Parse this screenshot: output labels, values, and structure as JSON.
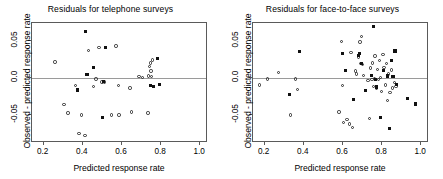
{
  "figure": {
    "width": 443,
    "height": 179,
    "background": "#ffffff",
    "marker_colors": {
      "open_circle": "#2b2b2b",
      "filled_square": "#111111",
      "zero_line": "#9a9a9a",
      "axis": "#5a5a5a"
    }
  },
  "chart_data": [
    {
      "type": "scatter",
      "title": "Residuals for telephone surveys",
      "xlabel": "Predicted response rate",
      "ylabel": "Observed - predicted response rate",
      "xlim": [
        0.14,
        1.04
      ],
      "ylim": [
        -0.088,
        0.075
      ],
      "xticks": [
        0.2,
        0.4,
        0.6,
        0.8,
        1.0
      ],
      "xticklabels": [
        "0.2",
        "0.4",
        "0.6",
        "0.8",
        "1.0"
      ],
      "yticks": [
        -0.05,
        0.0,
        0.05
      ],
      "yticklabels": [
        "-0.05",
        "0.0",
        "0.05"
      ],
      "grid": false,
      "legend": "none",
      "annotations": [
        {
          "type": "hline",
          "y": 0.0,
          "color": "#9a9a9a"
        }
      ],
      "series": [
        {
          "name": "open circles",
          "marker": "open-circle",
          "points": [
            [
              0.258,
              0.022
            ],
            [
              0.303,
              -0.036
            ],
            [
              0.323,
              -0.047
            ],
            [
              0.363,
              -0.01
            ],
            [
              0.381,
              -0.075
            ],
            [
              0.392,
              -0.05
            ],
            [
              0.41,
              -0.078
            ],
            [
              0.428,
              0.038
            ],
            [
              0.455,
              -0.011
            ],
            [
              0.468,
              -0.001
            ],
            [
              0.482,
              0.042
            ],
            [
              0.498,
              -0.005
            ],
            [
              0.512,
              -0.005
            ],
            [
              0.545,
              -0.05
            ],
            [
              0.57,
              0.044
            ],
            [
              0.583,
              -0.01
            ],
            [
              0.585,
              -0.05
            ],
            [
              0.641,
              -0.013
            ],
            [
              0.648,
              -0.046
            ],
            [
              0.687,
              0.002
            ],
            [
              0.704,
              0.001
            ],
            [
              0.733,
              -0.047
            ],
            [
              0.735,
              0.003
            ],
            [
              0.742,
              0.016
            ],
            [
              0.745,
              0.021
            ],
            [
              0.748,
              0.01
            ],
            [
              0.752,
              0.002
            ],
            [
              0.757,
              0.025
            ]
          ]
        },
        {
          "name": "filled squares",
          "marker": "filled-square",
          "points": [
            [
              0.372,
              -0.016
            ],
            [
              0.415,
              0.063
            ],
            [
              0.421,
              0.005
            ],
            [
              0.455,
              0.014
            ],
            [
              0.501,
              -0.053
            ],
            [
              0.507,
              -0.005
            ],
            [
              0.515,
              0.042
            ],
            [
              0.747,
              -0.01
            ],
            [
              0.762,
              -0.011
            ],
            [
              0.782,
              0.027
            ],
            [
              0.79,
              -0.009
            ]
          ]
        }
      ]
    },
    {
      "type": "scatter",
      "title": "Residuals for face-to-face surveys",
      "xlabel": "Predicted response rate",
      "ylabel": "Observed - predicted response rate",
      "xlim": [
        0.14,
        1.04
      ],
      "ylim": [
        -0.088,
        0.075
      ],
      "xticks": [
        0.2,
        0.4,
        0.6,
        0.8,
        1.0
      ],
      "xticklabels": [
        "0.2",
        "0.4",
        "0.6",
        "0.8",
        "1.0"
      ],
      "yticks": [
        -0.05,
        0.0,
        0.05
      ],
      "yticklabels": [
        "-0.05",
        "0.0",
        "0.05"
      ],
      "grid": false,
      "legend": "none",
      "annotations": [
        {
          "type": "hline",
          "y": 0.0,
          "color": "#9a9a9a"
        }
      ],
      "series": [
        {
          "name": "open circles",
          "marker": "open-circle",
          "points": [
            [
              0.172,
              -0.009
            ],
            [
              0.213,
              -0.001
            ],
            [
              0.27,
              0.008
            ],
            [
              0.33,
              -0.05
            ],
            [
              0.356,
              -0.001
            ],
            [
              0.366,
              -0.015
            ],
            [
              0.58,
              -0.046
            ],
            [
              0.592,
              0.05
            ],
            [
              0.596,
              -0.01
            ],
            [
              0.604,
              -0.06
            ],
            [
              0.62,
              -0.056
            ],
            [
              0.634,
              -0.062
            ],
            [
              0.64,
              0.035
            ],
            [
              0.648,
              -0.067
            ],
            [
              0.664,
              0.01
            ],
            [
              0.668,
              0.006
            ],
            [
              0.68,
              0.029
            ],
            [
              0.686,
              0.049
            ],
            [
              0.69,
              0.02
            ],
            [
              0.694,
              0.057
            ],
            [
              0.7,
              0.019
            ],
            [
              0.706,
              0.004
            ],
            [
              0.728,
              -0.003
            ],
            [
              0.736,
              -0.055
            ],
            [
              0.742,
              0.014
            ],
            [
              0.748,
              -0.002
            ],
            [
              0.752,
              0.021
            ],
            [
              0.756,
              -0.011
            ],
            [
              0.76,
              0.0
            ],
            [
              0.764,
              0.03
            ],
            [
              0.77,
              -0.013
            ],
            [
              0.776,
              0.012
            ],
            [
              0.782,
              -0.002
            ],
            [
              0.788,
              0.024
            ],
            [
              0.792,
              0.001
            ],
            [
              0.798,
              -0.018
            ],
            [
              0.804,
              0.032
            ],
            [
              0.81,
              0.015
            ],
            [
              0.816,
              -0.009
            ],
            [
              0.822,
              0.02
            ],
            [
              0.828,
              -0.03
            ],
            [
              0.834,
              0.006
            ],
            [
              0.84,
              -0.019
            ],
            [
              0.848,
              0.011
            ],
            [
              0.854,
              -0.013
            ],
            [
              0.862,
              -0.006
            ],
            [
              0.872,
              -0.011
            ]
          ]
        },
        {
          "name": "filled squares",
          "marker": "filled-square",
          "points": [
            [
              0.326,
              -0.022
            ],
            [
              0.38,
              0.036
            ],
            [
              0.598,
              0.033
            ],
            [
              0.614,
              0.011
            ],
            [
              0.652,
              -0.029
            ],
            [
              0.678,
              0.031
            ],
            [
              0.684,
              0.034
            ],
            [
              0.694,
              0.02
            ],
            [
              0.716,
              -0.017
            ],
            [
              0.746,
              0.004
            ],
            [
              0.756,
              0.07
            ],
            [
              0.766,
              -0.002
            ],
            [
              0.772,
              -0.012
            ],
            [
              0.792,
              -0.053
            ],
            [
              0.806,
              0.01
            ],
            [
              0.828,
              0.003
            ],
            [
              0.836,
              -0.068
            ],
            [
              0.848,
              0.024
            ],
            [
              0.856,
              0.002
            ],
            [
              0.866,
              0.037
            ],
            [
              0.874,
              -0.008
            ],
            [
              0.928,
              -0.028
            ],
            [
              0.972,
              -0.035
            ]
          ]
        }
      ]
    }
  ]
}
